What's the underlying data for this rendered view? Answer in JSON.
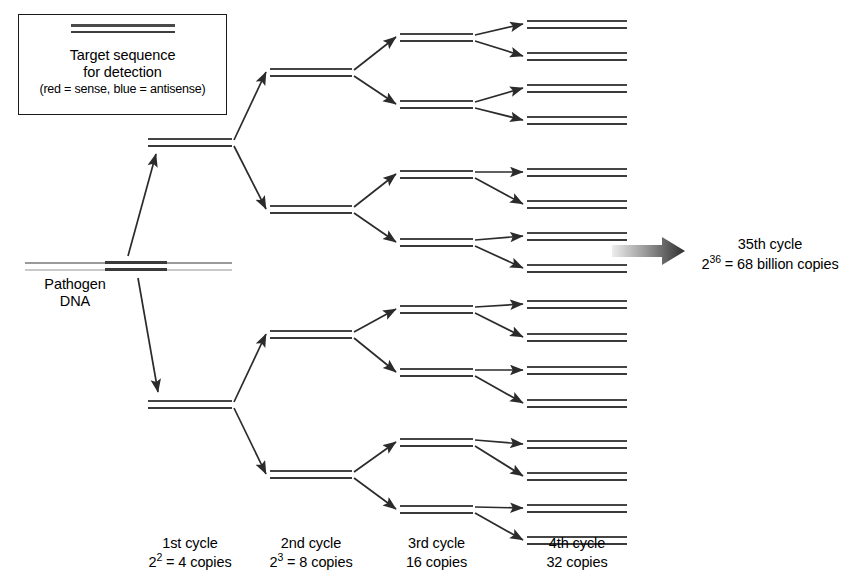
{
  "diagram": {
    "background_color": "#ffffff",
    "ink_color": "#333333"
  },
  "legend": {
    "line1": "Target sequence",
    "line2": "for detection",
    "line3": "(red = sense, blue = antisense)",
    "sense_color": "#4a4a4a",
    "antisense_color": "#3d3d3d"
  },
  "source": {
    "label_line1": "Pathogen",
    "label_line2": "DNA",
    "genomic_color": "#9a9a9a",
    "target_color": "#3a3a3a"
  },
  "cycles": [
    {
      "id": "cycle-1",
      "label_line1": "1st cycle",
      "label_base": "2",
      "label_exponent": "2",
      "label_rest": " = 4 copies",
      "duplex_count": 2,
      "copies": 4
    },
    {
      "id": "cycle-2",
      "label_line1": "2nd cycle",
      "label_base": "2",
      "label_exponent": "3",
      "label_rest": " = 8 copies",
      "duplex_count": 4,
      "copies": 8
    },
    {
      "id": "cycle-3",
      "label_line1": "3rd cycle",
      "label_base": "",
      "label_exponent": "",
      "label_rest": "16 copies",
      "duplex_count": 8,
      "copies": 16
    },
    {
      "id": "cycle-4",
      "label_line1": "4th cycle",
      "label_base": "",
      "label_exponent": "",
      "label_rest": "32 copies",
      "duplex_count": 16,
      "copies": 32
    }
  ],
  "final": {
    "line1": "35th cycle",
    "base": "2",
    "exponent": "36",
    "rest": " = 68 billion copies",
    "arrow_from_color": "#e8e8e8",
    "arrow_to_color": "#2e2e2e"
  },
  "geometry": {
    "duplex_widths": {
      "c1": 84,
      "c2": 82,
      "c3": 73,
      "c4": 100
    },
    "duplex_x": {
      "c1": 148,
      "c2": 270,
      "c3": 400,
      "c4": 527
    },
    "duplex_y": {
      "c1": [
        138,
        400
      ],
      "c2": [
        68,
        205,
        330,
        470
      ],
      "c3": [
        33,
        100,
        170,
        238,
        305,
        368,
        438,
        505
      ],
      "c4": [
        20,
        52,
        84,
        116,
        168,
        200,
        232,
        264,
        300,
        333,
        366,
        399,
        440,
        472,
        504,
        536
      ]
    },
    "genomic": {
      "x": 25,
      "y": 262,
      "width": 207,
      "target_x": 80,
      "target_width": 62
    }
  }
}
